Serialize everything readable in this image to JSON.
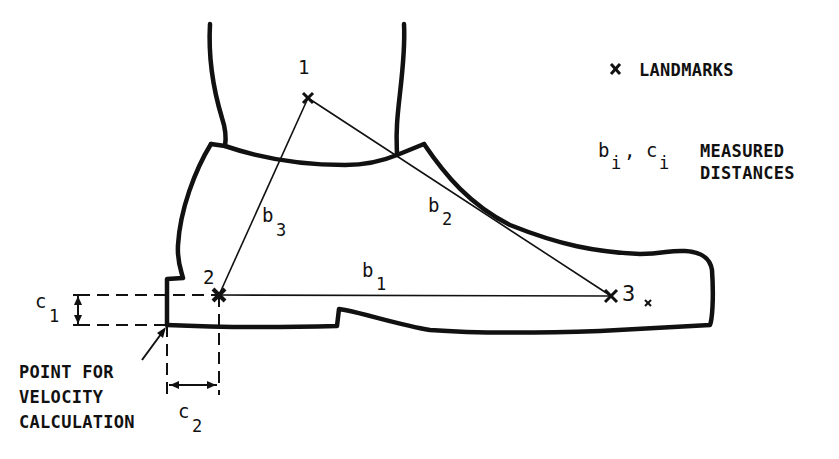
{
  "diagram": {
    "landmarks": [
      {
        "id": "1",
        "label": "1",
        "x": 308,
        "y": 98
      },
      {
        "id": "2",
        "label": "2",
        "x": 219,
        "y": 295
      },
      {
        "id": "3",
        "label": "3",
        "x": 611,
        "y": 296
      }
    ],
    "distances": [
      {
        "name": "b",
        "sub": "1",
        "from": "2",
        "to": "3"
      },
      {
        "name": "b",
        "sub": "2",
        "from": "1",
        "to": "3"
      },
      {
        "name": "b",
        "sub": "3",
        "from": "1",
        "to": "2"
      },
      {
        "name": "c",
        "sub": "1",
        "kind": "vertical offset"
      },
      {
        "name": "c",
        "sub": "2",
        "kind": "horizontal offset"
      }
    ],
    "labels": {
      "b1_main": "b",
      "b1_sub": "1",
      "b2_main": "b",
      "b2_sub": "2",
      "b3_main": "b",
      "b3_sub": "3",
      "c1_main": "c",
      "c1_sub": "1",
      "c2_main": "c",
      "c2_sub": "2",
      "point1": "1",
      "point2": "2",
      "point3": "3"
    },
    "legend": {
      "landmark_symbol": "×",
      "landmark_text": "LANDMARKS",
      "distance_symbol_b": "b",
      "distance_symbol_b_sub": "i",
      "distance_sep": ",",
      "distance_symbol_c": "c",
      "distance_symbol_c_sub": "i",
      "distance_text_line1": "MEASURED",
      "distance_text_line2": "DISTANCES"
    },
    "caption": {
      "line1": "POINT FOR",
      "line2": "VELOCITY",
      "line3": "CALCULATION"
    }
  }
}
